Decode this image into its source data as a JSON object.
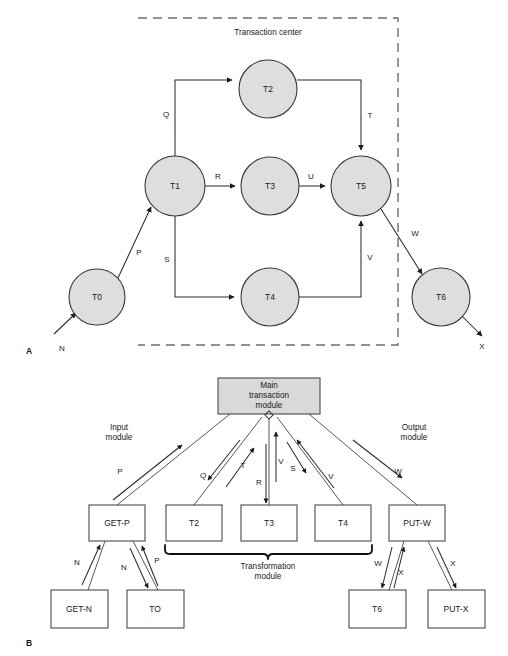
{
  "figure": {
    "panels": [
      {
        "id": "A",
        "label": "A"
      },
      {
        "id": "B",
        "label": "B"
      }
    ]
  },
  "panel_a": {
    "group_label": "Transaction center",
    "nodes": [
      {
        "id": "T0",
        "label": "T0",
        "cx": 97,
        "cy": 297,
        "r": 28
      },
      {
        "id": "T1",
        "label": "T1",
        "cx": 175,
        "cy": 186,
        "r": 30
      },
      {
        "id": "T2",
        "label": "T2",
        "cx": 268,
        "cy": 89,
        "r": 29
      },
      {
        "id": "T3",
        "label": "T3",
        "cx": 270,
        "cy": 186,
        "r": 29
      },
      {
        "id": "T4",
        "label": "T4",
        "cx": 270,
        "cy": 297,
        "r": 29
      },
      {
        "id": "T5",
        "label": "T5",
        "cx": 361,
        "cy": 186,
        "r": 30
      },
      {
        "id": "T6",
        "label": "T6",
        "cx": 441,
        "cy": 297,
        "r": 29
      }
    ],
    "edges": [
      {
        "id": "N",
        "label": "N",
        "from": "input",
        "to": "T0"
      },
      {
        "id": "P",
        "label": "P",
        "from": "T0",
        "to": "T1"
      },
      {
        "id": "Q",
        "label": "Q",
        "from": "T1",
        "to": "T2"
      },
      {
        "id": "R",
        "label": "R",
        "from": "T1",
        "to": "T3"
      },
      {
        "id": "S",
        "label": "S",
        "from": "T1",
        "to": "T4"
      },
      {
        "id": "T",
        "label": "T",
        "from": "T2",
        "to": "T5"
      },
      {
        "id": "U",
        "label": "U",
        "from": "T3",
        "to": "T5"
      },
      {
        "id": "V",
        "label": "V",
        "from": "T4",
        "to": "T5"
      },
      {
        "id": "W",
        "label": "W",
        "from": "T5",
        "to": "T6"
      },
      {
        "id": "X",
        "label": "X",
        "from": "T6",
        "to": "output"
      }
    ]
  },
  "panel_b": {
    "main_module": {
      "lines": [
        "Main",
        "transaction",
        "module"
      ]
    },
    "side_labels": {
      "input": [
        "Input",
        "module"
      ],
      "output": [
        "Output",
        "module"
      ],
      "transformation": [
        "Transformation",
        "module"
      ]
    },
    "boxes": [
      {
        "id": "GET-P",
        "label": "GET-P",
        "row": "mid",
        "x": 89,
        "y": 505,
        "w": 56,
        "h": 36
      },
      {
        "id": "T2",
        "label": "T2",
        "row": "mid",
        "x": 166,
        "y": 505,
        "w": 56,
        "h": 36
      },
      {
        "id": "T3",
        "label": "T3",
        "row": "mid",
        "x": 241,
        "y": 505,
        "w": 56,
        "h": 36
      },
      {
        "id": "T4",
        "label": "T4",
        "row": "mid",
        "x": 315,
        "y": 505,
        "w": 56,
        "h": 36
      },
      {
        "id": "PUT-W",
        "label": "PUT-W",
        "row": "mid",
        "x": 389,
        "y": 505,
        "w": 56,
        "h": 36
      },
      {
        "id": "GET-N",
        "label": "GET-N",
        "row": "bottom",
        "x": 51,
        "y": 590,
        "w": 57,
        "h": 38
      },
      {
        "id": "TO",
        "label": "TO",
        "row": "bottom",
        "x": 127,
        "y": 590,
        "w": 57,
        "h": 38
      },
      {
        "id": "T6",
        "label": "T6",
        "row": "bottom",
        "x": 349,
        "y": 590,
        "w": 57,
        "h": 38
      },
      {
        "id": "PUT-X",
        "label": "PUT-X",
        "row": "bottom",
        "x": 428,
        "y": 590,
        "w": 57,
        "h": 38
      }
    ],
    "flow_labels": [
      {
        "id": "P",
        "label": "P",
        "x": 120,
        "y": 472
      },
      {
        "id": "Q",
        "label": "Q",
        "x": 203,
        "y": 476
      },
      {
        "id": "T",
        "label": "T",
        "x": 243,
        "y": 466
      },
      {
        "id": "R",
        "label": "R",
        "x": 262,
        "y": 483
      },
      {
        "id": "V1",
        "label": "V",
        "x": 280,
        "y": 462
      },
      {
        "id": "S",
        "label": "S",
        "x": 293,
        "y": 468
      },
      {
        "id": "V2",
        "label": "V",
        "x": 331,
        "y": 476
      },
      {
        "id": "W",
        "label": "W",
        "x": 398,
        "y": 472
      },
      {
        "id": "N1",
        "label": "N",
        "x": 80,
        "y": 563
      },
      {
        "id": "N2",
        "label": "N",
        "x": 126,
        "y": 568
      },
      {
        "id": "P2",
        "label": "P",
        "x": 157,
        "y": 561
      },
      {
        "id": "W2",
        "label": "W",
        "x": 379,
        "y": 564
      },
      {
        "id": "X1",
        "label": "X",
        "x": 400,
        "y": 572
      },
      {
        "id": "X2",
        "label": "X",
        "x": 453,
        "y": 564
      }
    ]
  },
  "colors": {
    "node_fill": "#dededc",
    "node_stroke": "#3a3a3a",
    "box_fill": "#ffffff",
    "shaded_fill": "#d9d9d7",
    "edge": "#2c2c2c",
    "dashed": "#6e6e6e",
    "text": "#1a1a1a"
  }
}
